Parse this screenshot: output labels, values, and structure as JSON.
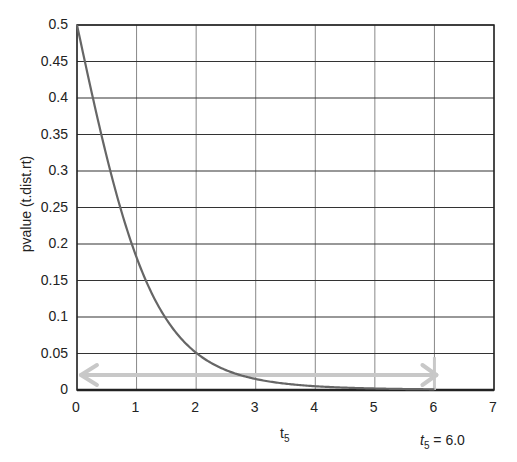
{
  "chart_data": {
    "type": "line",
    "title": "",
    "xlabel": "t5",
    "ylabel": "pvalue  (t.dist.rt)",
    "xlim": [
      0,
      7
    ],
    "ylim": [
      0,
      0.5
    ],
    "grid": true,
    "legend": null,
    "x_ticks": [
      "0",
      "1",
      "2",
      "3",
      "4",
      "5",
      "6",
      "7"
    ],
    "y_ticks": [
      "0",
      "0.05",
      "0.1",
      "0.15",
      "0.2",
      "0.25",
      "0.3",
      "0.35",
      "0.4",
      "0.45",
      "0.5"
    ],
    "series": [
      {
        "name": "pvalue (t.dist.rt, df=5)",
        "color": "#666666",
        "x": [
          0,
          0.25,
          0.5,
          0.75,
          1.0,
          1.25,
          1.5,
          1.75,
          2.0,
          2.5,
          3.0,
          3.5,
          4.0,
          4.5,
          5.0,
          5.5,
          6.0
        ],
        "y": [
          0.5,
          0.406,
          0.319,
          0.244,
          0.182,
          0.133,
          0.097,
          0.07,
          0.051,
          0.027,
          0.015,
          0.009,
          0.005,
          0.003,
          0.002,
          0.0014,
          0.0009
        ]
      }
    ],
    "annotations": [
      {
        "type": "double-arrow",
        "from_x": 0.1,
        "to_x": 6.0,
        "y": 0.02,
        "color": "#c8c8c8"
      },
      {
        "type": "vertical-marker",
        "x": 6.0,
        "y_from": 0.0,
        "y_to": 0.045,
        "color": "#c8c8c8"
      },
      {
        "type": "text",
        "text": "t5 = 6.0",
        "position": "below x-axis near x=6"
      }
    ]
  },
  "labels": {
    "ylabel": "pvalue  (t.dist.rt)",
    "xlabel_main": "t",
    "xlabel_sub": "5",
    "annot_main": "t",
    "annot_sub": "5",
    "annot_value": " = 6.0"
  },
  "ticks": {
    "y": [
      "0.5",
      "0.45",
      "0.4",
      "0.35",
      "0.3",
      "0.25",
      "0.2",
      "0.15",
      "0.1",
      "0.05",
      "0"
    ],
    "x": [
      "0",
      "1",
      "2",
      "3",
      "4",
      "5",
      "6",
      "7"
    ]
  }
}
